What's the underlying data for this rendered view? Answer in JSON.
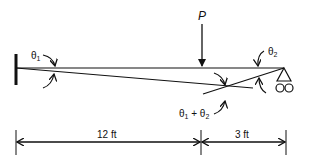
{
  "diagram": {
    "type": "beam-deflection",
    "load_label": "P",
    "angle_left": {
      "symbol": "θ",
      "sub": "1"
    },
    "angle_right": {
      "symbol": "θ",
      "sub": "2"
    },
    "angle_sum": {
      "text": "θ",
      "sub1": "1",
      "plus": " + θ",
      "sub2": "2"
    },
    "dimensions": [
      {
        "label": "12 ft"
      },
      {
        "label": "3 ft"
      }
    ],
    "colors": {
      "stroke": "#111111",
      "background": "#ffffff"
    }
  }
}
